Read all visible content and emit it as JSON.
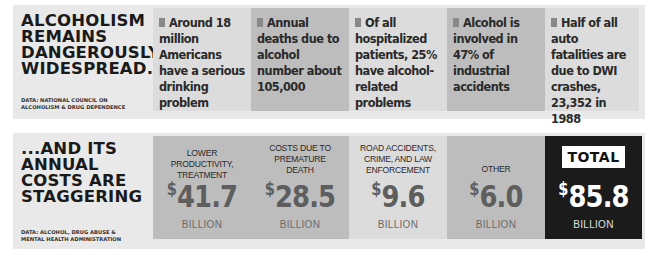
{
  "top_panel": {
    "headline": [
      "ALCOHOLISM",
      "REMAINS",
      "DANGEROUSLY",
      "WIDESPREAD..."
    ],
    "source": [
      "DATA: NATIONAL COUNCIL ON",
      "ALCOHOLISM & DRUG DEPENDENCE"
    ],
    "facts": [
      {
        "text": "Around 18 million Americans have a serious drinking problem",
        "shade": "light"
      },
      {
        "text": "Annual deaths due to alcohol number about 105,000",
        "shade": "mid"
      },
      {
        "text": "Of all hospitalized patients, 25% have alcohol-related problems",
        "shade": "light"
      },
      {
        "text": "Alcohol is involved in 47% of industrial accidents",
        "shade": "mid"
      },
      {
        "text": "Half of all auto fatalities are due to DWI crashes, 23,352 in 1988",
        "shade": "light"
      }
    ]
  },
  "bottom_panel": {
    "headline": [
      "...AND ITS",
      "ANNUAL",
      "COSTS ARE",
      "STAGGERING"
    ],
    "source": [
      "DATA: ALCOHOL, DRUG ABUSE &",
      "MENTAL HEALTH ADMINISTRATION"
    ],
    "costs": [
      {
        "label": "LOWER PRODUCTIVITY, TREATMENT",
        "currency": "$",
        "value": "41.7",
        "unit": "BILLION",
        "shade": "mid"
      },
      {
        "label": "COSTS DUE TO PREMATURE DEATH",
        "currency": "$",
        "value": "28.5",
        "unit": "BILLION",
        "shade": "mid"
      },
      {
        "label": "ROAD ACCIDENTS, CRIME, AND LAW ENFORCEMENT",
        "currency": "$",
        "value": "9.6",
        "unit": "BILLION",
        "shade": "light"
      },
      {
        "label": "OTHER",
        "currency": "$",
        "value": "6.0",
        "unit": "BILLION",
        "shade": "mid"
      }
    ],
    "total": {
      "badge": "TOTAL",
      "currency": "$",
      "value": "85.8",
      "unit": "BILLION"
    }
  },
  "colors": {
    "panel_bg": "#e9e9e9",
    "light_cell": "#dcdcdc",
    "mid_cell": "#bdbdbd",
    "total_cell": "#1b1b1b"
  }
}
